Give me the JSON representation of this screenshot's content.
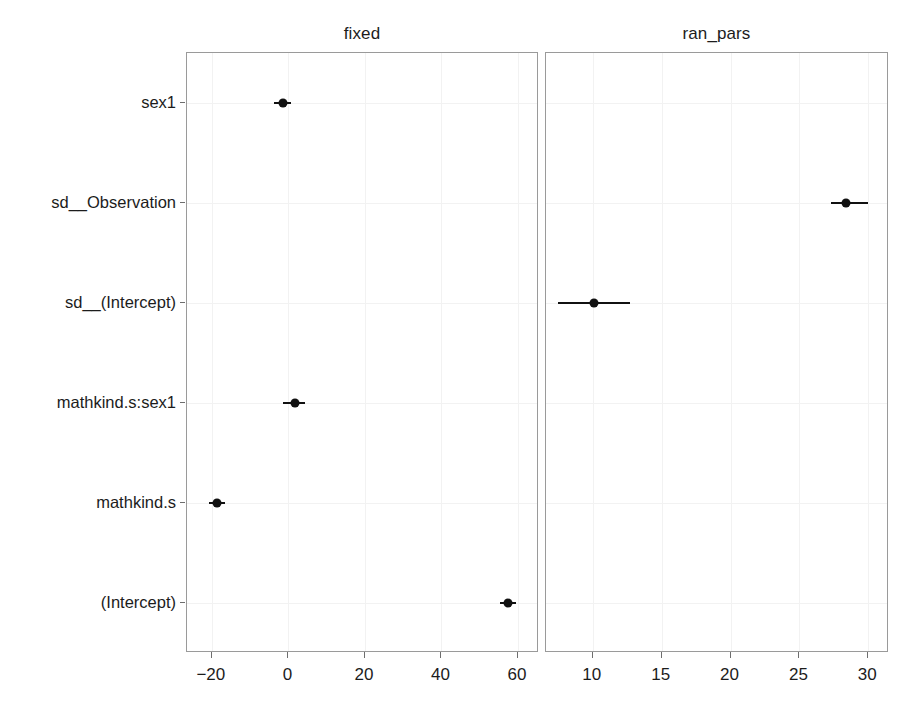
{
  "chart_data": {
    "type": "scatter",
    "title": "",
    "subtitle": "",
    "xlabel": "",
    "ylabel": "",
    "grid": true,
    "legend": "none",
    "orientation": "horizontal",
    "facets": [
      {
        "name": "fixed",
        "label": "fixed",
        "xlim": [
          -26.5,
          65.5
        ],
        "xticks": [
          -20,
          0,
          20,
          40,
          60
        ],
        "xticklabels": [
          "-20",
          "0",
          "20",
          "40",
          "60"
        ]
      },
      {
        "name": "ran_pars",
        "label": "ran_pars",
        "xlim": [
          6.6,
          31.5
        ],
        "xticks": [
          10,
          15,
          20,
          25,
          30
        ],
        "xticklabels": [
          "10",
          "15",
          "20",
          "25",
          "30"
        ]
      }
    ],
    "categories": [
      "sex1",
      "sd__Observation",
      "sd__(Intercept)",
      "mathkind.s:sex1",
      "mathkind.s",
      "(Intercept)"
    ],
    "points": [
      {
        "term": "sex1",
        "facet": "fixed",
        "estimate": -1.5,
        "conf_low": -3.7,
        "conf_high": 0.8
      },
      {
        "term": "sd__Observation",
        "facet": "ran_pars",
        "estimate": 28.4,
        "conf_low": 27.3,
        "conf_high": 30.0
      },
      {
        "term": "sd__(Intercept)",
        "facet": "ran_pars",
        "estimate": 10.1,
        "conf_low": 7.5,
        "conf_high": 12.7
      },
      {
        "term": "mathkind.s:sex1",
        "facet": "fixed",
        "estimate": 1.6,
        "conf_low": -1.3,
        "conf_high": 4.4
      },
      {
        "term": "mathkind.s",
        "facet": "fixed",
        "estimate": -18.7,
        "conf_low": -20.8,
        "conf_high": -16.6
      },
      {
        "term": "(Intercept)",
        "facet": "fixed",
        "estimate": 57.4,
        "conf_low": 55.2,
        "conf_high": 59.6
      }
    ],
    "colors": {
      "point": "#111111",
      "errorbar": "#111111",
      "panel_border": "#9a9a9a",
      "gridline": "#f2f2f2",
      "background": "#ffffff",
      "text": "#1c1c1c"
    }
  },
  "axes": {
    "y_terms": [
      "sex1",
      "sd__Observation",
      "sd__(Intercept)",
      "mathkind.s:sex1",
      "mathkind.s",
      "(Intercept)"
    ],
    "fixed_x_labels": [
      "-20",
      "0",
      "20",
      "40",
      "60"
    ],
    "ranpars_x_labels": [
      "10",
      "15",
      "20",
      "25",
      "30"
    ]
  },
  "strips": {
    "fixed": "fixed",
    "ran_pars": "ran_pars"
  }
}
